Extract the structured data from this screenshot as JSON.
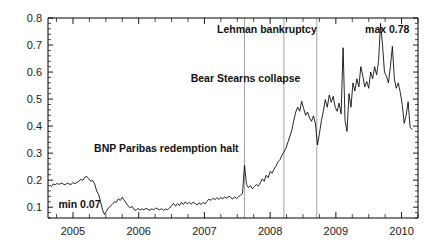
{
  "chart_data": {
    "type": "line",
    "title": "",
    "subtitle": "",
    "xlabel": "",
    "ylabel": "",
    "xlim": [
      2004.62,
      2010.25
    ],
    "ylim": [
      0.06,
      0.8
    ],
    "grid": false,
    "legend": "none",
    "y_ticks": [
      "0.1",
      "0.2",
      "0.3",
      "0.4",
      "0.5",
      "0.6",
      "0.7",
      "0.8"
    ],
    "y_tick_values": [
      0.1,
      0.2,
      0.3,
      0.4,
      0.5,
      0.6,
      0.7,
      0.8
    ],
    "y_minor_step": 0.02,
    "x_ticks": [
      "2005",
      "2006",
      "2007",
      "2008",
      "2009",
      "2010"
    ],
    "x_tick_values": [
      2005,
      2006,
      2007,
      2008,
      2009,
      2010
    ],
    "x_minor_step": 0.25,
    "series_name": "spread",
    "series_color": "#000000",
    "annotations": [
      {
        "text": "Lehman bankruptcy",
        "x": 2008.71,
        "y": 0.745,
        "anchor": "end"
      },
      {
        "text": "max 0.78",
        "x": 2010.12,
        "y": 0.745,
        "anchor": "end"
      },
      {
        "text": "Bear Stearns collapse",
        "x": 2008.46,
        "y": 0.565,
        "anchor": "end"
      },
      {
        "text": "BNP Paribas redemption halt",
        "x": 2007.52,
        "y": 0.305,
        "anchor": "end"
      },
      {
        "text": "min 0.07",
        "x": 2004.78,
        "y": 0.098,
        "anchor": "start"
      }
    ],
    "event_lines": [
      {
        "label": "BNP Paribas redemption halt",
        "x": 2007.61
      },
      {
        "label": "Bear Stearns collapse",
        "x": 2008.21
      },
      {
        "label": "Lehman bankruptcy",
        "x": 2008.71
      }
    ],
    "min_value": 0.07,
    "max_value": 0.78,
    "x": [
      2004.67,
      2004.7,
      2004.73,
      2004.76,
      2004.79,
      2004.82,
      2004.85,
      2004.88,
      2004.91,
      2004.94,
      2004.97,
      2005.0,
      2005.03,
      2005.06,
      2005.09,
      2005.12,
      2005.15,
      2005.18,
      2005.21,
      2005.24,
      2005.27,
      2005.3,
      2005.33,
      2005.36,
      2005.39,
      2005.42,
      2005.45,
      2005.48,
      2005.51,
      2005.54,
      2005.57,
      2005.6,
      2005.63,
      2005.66,
      2005.69,
      2005.72,
      2005.75,
      2005.78,
      2005.81,
      2005.84,
      2005.87,
      2005.9,
      2005.93,
      2005.96,
      2005.99,
      2006.02,
      2006.05,
      2006.08,
      2006.11,
      2006.14,
      2006.17,
      2006.2,
      2006.23,
      2006.26,
      2006.29,
      2006.32,
      2006.35,
      2006.38,
      2006.41,
      2006.44,
      2006.47,
      2006.5,
      2006.53,
      2006.56,
      2006.59,
      2006.62,
      2006.65,
      2006.68,
      2006.71,
      2006.74,
      2006.77,
      2006.8,
      2006.83,
      2006.86,
      2006.89,
      2006.92,
      2006.95,
      2006.98,
      2007.01,
      2007.04,
      2007.07,
      2007.1,
      2007.13,
      2007.16,
      2007.19,
      2007.22,
      2007.25,
      2007.28,
      2007.31,
      2007.34,
      2007.37,
      2007.4,
      2007.43,
      2007.46,
      2007.49,
      2007.52,
      2007.55,
      2007.58,
      2007.61,
      2007.64,
      2007.67,
      2007.7,
      2007.73,
      2007.76,
      2007.79,
      2007.82,
      2007.85,
      2007.88,
      2007.91,
      2007.94,
      2007.97,
      2008.0,
      2008.03,
      2008.06,
      2008.09,
      2008.12,
      2008.15,
      2008.18,
      2008.21,
      2008.24,
      2008.27,
      2008.3,
      2008.33,
      2008.36,
      2008.39,
      2008.42,
      2008.45,
      2008.48,
      2008.51,
      2008.54,
      2008.57,
      2008.6,
      2008.63,
      2008.66,
      2008.69,
      2008.72,
      2008.75,
      2008.78,
      2008.81,
      2008.84,
      2008.87,
      2008.9,
      2008.93,
      2008.96,
      2008.99,
      2009.02,
      2009.05,
      2009.08,
      2009.11,
      2009.14,
      2009.17,
      2009.2,
      2009.23,
      2009.26,
      2009.29,
      2009.32,
      2009.35,
      2009.38,
      2009.41,
      2009.44,
      2009.47,
      2009.5,
      2009.53,
      2009.56,
      2009.59,
      2009.62,
      2009.65,
      2009.68,
      2009.71,
      2009.74,
      2009.77,
      2009.8,
      2009.83,
      2009.86,
      2009.89,
      2009.92,
      2009.95,
      2009.98,
      2010.01,
      2010.04,
      2010.07,
      2010.1,
      2010.13,
      2010.16
    ],
    "y": [
      0.175,
      0.186,
      0.183,
      0.188,
      0.184,
      0.19,
      0.186,
      0.182,
      0.189,
      0.186,
      0.184,
      0.191,
      0.187,
      0.192,
      0.196,
      0.203,
      0.199,
      0.211,
      0.214,
      0.205,
      0.196,
      0.199,
      0.186,
      0.16,
      0.148,
      0.12,
      0.09,
      0.073,
      0.085,
      0.098,
      0.104,
      0.111,
      0.12,
      0.118,
      0.131,
      0.125,
      0.137,
      0.126,
      0.115,
      0.105,
      0.097,
      0.103,
      0.091,
      0.088,
      0.096,
      0.089,
      0.094,
      0.09,
      0.096,
      0.092,
      0.089,
      0.094,
      0.09,
      0.097,
      0.093,
      0.09,
      0.095,
      0.088,
      0.093,
      0.091,
      0.097,
      0.106,
      0.114,
      0.104,
      0.113,
      0.106,
      0.118,
      0.11,
      0.12,
      0.112,
      0.118,
      0.111,
      0.119,
      0.114,
      0.108,
      0.116,
      0.11,
      0.118,
      0.112,
      0.122,
      0.13,
      0.125,
      0.133,
      0.128,
      0.135,
      0.129,
      0.136,
      0.131,
      0.138,
      0.133,
      0.141,
      0.136,
      0.13,
      0.138,
      0.132,
      0.139,
      0.144,
      0.152,
      0.256,
      0.185,
      0.172,
      0.18,
      0.168,
      0.176,
      0.184,
      0.178,
      0.19,
      0.205,
      0.196,
      0.218,
      0.209,
      0.232,
      0.226,
      0.241,
      0.252,
      0.268,
      0.276,
      0.292,
      0.305,
      0.318,
      0.34,
      0.362,
      0.385,
      0.42,
      0.452,
      0.47,
      0.455,
      0.492,
      0.465,
      0.44,
      0.452,
      0.43,
      0.418,
      0.438,
      0.408,
      0.33,
      0.372,
      0.42,
      0.455,
      0.498,
      0.47,
      0.515,
      0.488,
      0.51,
      0.47,
      0.455,
      0.485,
      0.445,
      0.69,
      0.42,
      0.38,
      0.52,
      0.47,
      0.56,
      0.53,
      0.575,
      0.545,
      0.62,
      0.585,
      0.545,
      0.565,
      0.54,
      0.6,
      0.575,
      0.62,
      0.59,
      0.64,
      0.78,
      0.7,
      0.6,
      0.585,
      0.56,
      0.62,
      0.695,
      0.575,
      0.54,
      0.56,
      0.525,
      0.48,
      0.41,
      0.44,
      0.49,
      0.395,
      0.388
    ]
  }
}
